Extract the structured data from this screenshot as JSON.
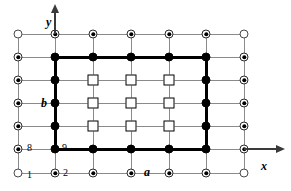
{
  "figure": {
    "axes": {
      "x_label": "x",
      "y_label": "y",
      "x_arrow_icon": "arrow-right-icon",
      "y_arrow_icon": "arrow-up-icon"
    },
    "labels": [
      {
        "id": "lbl-y",
        "text": "y",
        "x": 46,
        "y": 16,
        "style": "italic"
      },
      {
        "id": "lbl-x",
        "text": "x",
        "x": 261,
        "y": 160,
        "style": "italic"
      },
      {
        "id": "lbl-b",
        "text": "b",
        "x": 41,
        "y": 97,
        "style": "italic"
      },
      {
        "id": "lbl-a",
        "text": "a",
        "x": 144,
        "y": 166,
        "style": "italic"
      },
      {
        "id": "lbl-8",
        "text": "8",
        "x": 27,
        "y": 143,
        "style": "num"
      },
      {
        "id": "lbl-9",
        "text": "9",
        "x": 62,
        "y": 143,
        "style": "num"
      },
      {
        "id": "lbl-1",
        "text": "1",
        "x": 27,
        "y": 170,
        "style": "num"
      },
      {
        "id": "lbl-2",
        "text": "2",
        "x": 63,
        "y": 168,
        "style": "num"
      }
    ],
    "grid": {
      "columns_x": [
        18,
        55,
        93,
        131,
        169,
        206,
        244
      ],
      "rows_y": [
        34,
        57,
        80,
        103,
        126,
        149,
        173
      ],
      "columns_count": 7,
      "rows_count": 7,
      "line_color": "#8a8a8a",
      "bold_color": "#000000"
    },
    "node_legend": {
      "open-circle": "boundary corner site",
      "bullseye-circle": "outer boundary site",
      "filled-circle": "inner boundary site",
      "open-square": "interior site"
    },
    "nodes": [
      [
        "open",
        "bull",
        "bull",
        "bull",
        "bull",
        "bull",
        "open"
      ],
      [
        "bull",
        "fill",
        "fill",
        "fill",
        "fill",
        "fill",
        "bull"
      ],
      [
        "bull",
        "fill",
        "square",
        "square",
        "square",
        "fill",
        "bull"
      ],
      [
        "bull",
        "fill",
        "square",
        "square",
        "square",
        "fill",
        "bull"
      ],
      [
        "bull",
        "fill",
        "square",
        "square",
        "square",
        "fill",
        "bull"
      ],
      [
        "bull",
        "fill",
        "fill",
        "fill",
        "fill",
        "fill",
        "bull"
      ],
      [
        "open",
        "bull",
        "bull",
        "bull",
        "bull",
        "bull",
        "open"
      ]
    ]
  }
}
